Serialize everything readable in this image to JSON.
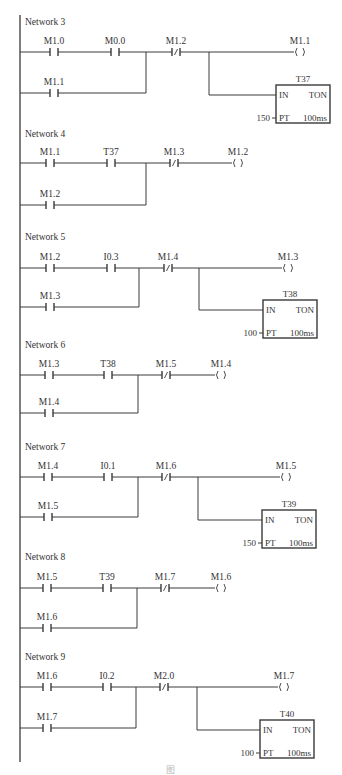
{
  "diagram": {
    "type": "ladder-logic",
    "left_rail": {
      "x": 20,
      "y1": 15,
      "y2": 762
    },
    "colors": {
      "line": "#3a3a3a",
      "text": "#333333",
      "background": "#ffffff",
      "caption": "#b8b8b8"
    },
    "networks": [
      {
        "label": "Network 3",
        "label_y": 25,
        "row1_y": 52,
        "row2_y": 93,
        "junction_x": 146,
        "branch_x": 209,
        "row1_contacts": [
          {
            "name": "M1.0",
            "type": "NO",
            "x": 54
          },
          {
            "name": "M0.0",
            "type": "NO",
            "x": 115
          },
          {
            "name": "M1.2",
            "type": "NC",
            "x": 176
          }
        ],
        "row2_contacts": [
          {
            "name": "M1.1",
            "type": "NO",
            "x": 54
          }
        ],
        "coil": {
          "name": "M1.1",
          "x": 300
        },
        "timer": {
          "name": "T37",
          "in": "IN",
          "type": "TON",
          "pt_label": "PT",
          "preset": "150",
          "base": "100ms",
          "box_x": 276,
          "box_y": 85,
          "box_w": 54,
          "box_h": 38
        }
      },
      {
        "label": "Network 4",
        "label_y": 137,
        "row1_y": 163,
        "row2_y": 205,
        "junction_x": 146,
        "row1_contacts": [
          {
            "name": "M1.1",
            "type": "NO",
            "x": 50
          },
          {
            "name": "T37",
            "type": "NO",
            "x": 111
          },
          {
            "name": "M1.3",
            "type": "NC",
            "x": 174
          }
        ],
        "row2_contacts": [
          {
            "name": "M1.2",
            "type": "NO",
            "x": 50
          }
        ],
        "coil": {
          "name": "M1.2",
          "x": 238
        }
      },
      {
        "label": "Network 5",
        "label_y": 240,
        "row1_y": 268,
        "row2_y": 307,
        "junction_x": 139,
        "branch_x": 199,
        "row1_contacts": [
          {
            "name": "M1.2",
            "type": "NO",
            "x": 50
          },
          {
            "name": "I0.3",
            "type": "NO",
            "x": 111
          },
          {
            "name": "M1.4",
            "type": "NC",
            "x": 168
          }
        ],
        "row2_contacts": [
          {
            "name": "M1.3",
            "type": "NO",
            "x": 50
          }
        ],
        "coil": {
          "name": "M1.3",
          "x": 288
        },
        "timer": {
          "name": "T38",
          "in": "IN",
          "type": "TON",
          "pt_label": "PT",
          "preset": "100",
          "base": "100ms",
          "box_x": 263,
          "box_y": 300,
          "box_w": 54,
          "box_h": 38
        }
      },
      {
        "label": "Network 6",
        "label_y": 348,
        "row1_y": 375,
        "row2_y": 413,
        "junction_x": 138,
        "row1_contacts": [
          {
            "name": "M1.3",
            "type": "NO",
            "x": 49
          },
          {
            "name": "T38",
            "type": "NO",
            "x": 108
          },
          {
            "name": "M1.5",
            "type": "NC",
            "x": 166
          }
        ],
        "row2_contacts": [
          {
            "name": "M1.4",
            "type": "NO",
            "x": 49
          }
        ],
        "coil": {
          "name": "M1.4",
          "x": 221
        }
      },
      {
        "label": "Network 7",
        "label_y": 450,
        "row1_y": 477,
        "row2_y": 517,
        "junction_x": 138,
        "branch_x": 198,
        "row1_contacts": [
          {
            "name": "M1.4",
            "type": "NO",
            "x": 48
          },
          {
            "name": "I0.1",
            "type": "NO",
            "x": 108
          },
          {
            "name": "M1.6",
            "type": "NC",
            "x": 166
          }
        ],
        "row2_contacts": [
          {
            "name": "M1.5",
            "type": "NO",
            "x": 48
          }
        ],
        "coil": {
          "name": "M1.5",
          "x": 286
        },
        "timer": {
          "name": "T39",
          "in": "IN",
          "type": "TON",
          "pt_label": "PT",
          "preset": "150",
          "base": "100ms",
          "box_x": 262,
          "box_y": 510,
          "box_w": 54,
          "box_h": 38
        }
      },
      {
        "label": "Network 8",
        "label_y": 560,
        "row1_y": 588,
        "row2_y": 628,
        "junction_x": 137,
        "row1_contacts": [
          {
            "name": "M1.5",
            "type": "NO",
            "x": 47
          },
          {
            "name": "T39",
            "type": "NO",
            "x": 107
          },
          {
            "name": "M1.7",
            "type": "NC",
            "x": 165
          }
        ],
        "row2_contacts": [
          {
            "name": "M1.6",
            "type": "NO",
            "x": 47
          }
        ],
        "coil": {
          "name": "M1.6",
          "x": 221
        }
      },
      {
        "label": "Network 9",
        "label_y": 660,
        "row1_y": 687,
        "row2_y": 728,
        "junction_x": 136,
        "branch_x": 197,
        "row1_contacts": [
          {
            "name": "M1.6",
            "type": "NO",
            "x": 47
          },
          {
            "name": "I0.2",
            "type": "NO",
            "x": 107
          },
          {
            "name": "M2.0",
            "type": "NC",
            "x": 164
          }
        ],
        "row2_contacts": [
          {
            "name": "M1.7",
            "type": "NO",
            "x": 47
          }
        ],
        "coil": {
          "name": "M1.7",
          "x": 284
        },
        "timer": {
          "name": "T40",
          "in": "IN",
          "type": "TON",
          "pt_label": "PT",
          "preset": "100",
          "base": "100ms",
          "box_x": 260,
          "box_y": 720,
          "box_w": 54,
          "box_h": 38
        }
      }
    ],
    "caption": "图"
  }
}
